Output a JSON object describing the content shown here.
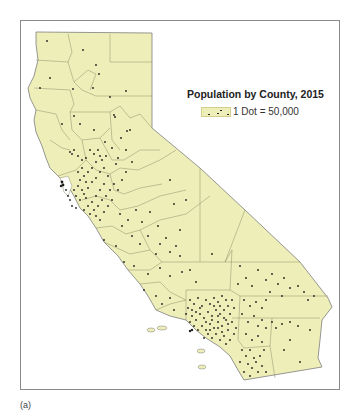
{
  "figure": {
    "caption": "(a)",
    "map_title": "Population by County, 2015",
    "legend": {
      "title": "Population by County, 2015",
      "entries": [
        {
          "symbol": "dot",
          "label": "1 Dot = 50,000"
        }
      ]
    },
    "region": "California",
    "colors": {
      "land_fill": "#eeefb8",
      "county_lines": "#8c8c6a",
      "dots": "#1f1f1f",
      "frame": "#8a8a8a",
      "water": "#ffffff"
    }
  }
}
